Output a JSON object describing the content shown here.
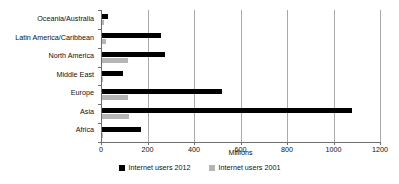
{
  "chart_data": {
    "type": "bar",
    "orientation": "horizontal",
    "title": "",
    "xlabel": "Millions",
    "ylabel": "",
    "xlim": [
      0,
      1200
    ],
    "xticks": [
      0,
      200,
      400,
      600,
      800,
      1000,
      1200
    ],
    "xtick_labels": [
      "0",
      "200",
      "400",
      "600",
      "800",
      "1000",
      "1200"
    ],
    "grid": "vertical",
    "legend_position": "bottom",
    "categories": [
      "Oceania/Australia",
      "Latin America/Caribbean",
      "North America",
      "Middle East",
      "Europe",
      "Asia",
      "Africa"
    ],
    "series": [
      {
        "name": "Internet users 2012",
        "color": "#000000",
        "values": [
          24,
          255,
          273,
          90,
          518,
          1077,
          167
        ]
      },
      {
        "name": "Internet users 2001",
        "color": "#b5b5b5",
        "values": [
          8,
          18,
          111,
          5,
          110,
          115,
          5
        ]
      }
    ]
  },
  "legend": {
    "items": [
      {
        "label": "Internet users 2012",
        "color": "#000000"
      },
      {
        "label": "Internet users 2001",
        "color": "#b5b5b5"
      }
    ]
  }
}
